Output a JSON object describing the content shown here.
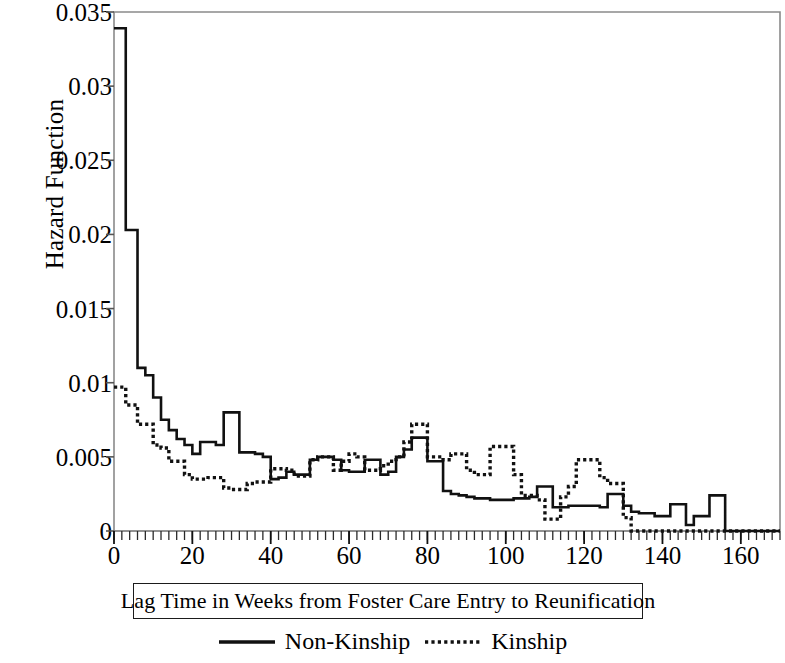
{
  "chart_data": {
    "type": "line",
    "title": "",
    "xlabel": "Lag Time in Weeks from Foster Care Entry to Reunification",
    "ylabel": "Hazard Function",
    "xlim": [
      0,
      170
    ],
    "ylim": [
      0,
      0.035
    ],
    "grid": false,
    "legend_position": "bottom",
    "xticks": [
      0,
      20,
      40,
      60,
      80,
      100,
      120,
      140,
      160
    ],
    "xtick_labels": [
      "0",
      "20",
      "40",
      "60",
      "80",
      "100",
      "120",
      "140",
      "160"
    ],
    "x_minor_tick_interval": 2,
    "yticks": [
      0,
      0.005,
      0.01,
      0.015,
      0.02,
      0.025,
      0.03,
      0.035
    ],
    "ytick_labels": [
      "0",
      "0.005",
      "0.01",
      "0.015",
      "0.02",
      "0.025",
      "0.03",
      "0.035"
    ],
    "line_style": "step-post",
    "series": [
      {
        "name": "Non-Kinship",
        "style": "solid",
        "color": "#111111",
        "x": [
          0,
          3,
          6,
          8,
          10,
          12,
          14,
          16,
          18,
          20,
          22,
          24,
          26,
          28,
          30,
          32,
          34,
          36,
          38,
          40,
          42,
          44,
          46,
          48,
          50,
          52,
          54,
          56,
          58,
          60,
          62,
          64,
          66,
          68,
          70,
          72,
          74,
          76,
          78,
          80,
          82,
          84,
          86,
          88,
          90,
          92,
          94,
          96,
          98,
          100,
          102,
          104,
          106,
          108,
          110,
          112,
          114,
          116,
          118,
          120,
          122,
          124,
          126,
          128,
          130,
          132,
          134,
          136,
          138,
          140,
          142,
          144,
          146,
          148,
          150,
          152,
          154,
          156,
          158,
          160,
          162,
          164,
          166,
          168,
          170
        ],
        "y": [
          0.0339,
          0.0203,
          0.011,
          0.0105,
          0.009,
          0.0075,
          0.0068,
          0.0062,
          0.0058,
          0.0052,
          0.006,
          0.006,
          0.0058,
          0.008,
          0.008,
          0.0053,
          0.0053,
          0.0052,
          0.005,
          0.0035,
          0.0036,
          0.004,
          0.0038,
          0.0038,
          0.0048,
          0.005,
          0.005,
          0.0048,
          0.0041,
          0.004,
          0.004,
          0.0048,
          0.0048,
          0.0038,
          0.004,
          0.005,
          0.0055,
          0.0063,
          0.0063,
          0.0047,
          0.0047,
          0.0027,
          0.0025,
          0.0024,
          0.0023,
          0.0022,
          0.0022,
          0.0021,
          0.0021,
          0.0021,
          0.0022,
          0.0022,
          0.0023,
          0.003,
          0.003,
          0.0016,
          0.0016,
          0.0017,
          0.0017,
          0.0017,
          0.0017,
          0.0016,
          0.0025,
          0.0025,
          0.0017,
          0.0013,
          0.0012,
          0.0012,
          0.001,
          0.001,
          0.0018,
          0.0018,
          0.0004,
          0.001,
          0.001,
          0.0024,
          0.0024,
          0.0,
          0.0,
          0.0,
          0.0,
          0.0,
          0.0,
          0.0,
          0.0
        ]
      },
      {
        "name": "Kinship",
        "style": "dotted",
        "color": "#111111",
        "x": [
          0,
          3,
          6,
          8,
          10,
          12,
          14,
          16,
          18,
          20,
          22,
          24,
          26,
          28,
          30,
          32,
          34,
          36,
          38,
          40,
          42,
          44,
          46,
          48,
          50,
          52,
          54,
          56,
          58,
          60,
          62,
          64,
          66,
          68,
          70,
          72,
          74,
          76,
          78,
          80,
          82,
          84,
          86,
          88,
          90,
          92,
          94,
          96,
          98,
          100,
          102,
          104,
          106,
          108,
          110,
          112,
          114,
          116,
          118,
          120,
          122,
          124,
          126,
          128,
          130,
          132,
          134,
          136,
          138,
          140,
          142,
          144,
          146,
          148,
          150,
          152,
          154,
          156,
          158,
          160,
          162,
          164,
          166,
          168,
          170
        ],
        "y": [
          0.0097,
          0.0085,
          0.0072,
          0.0072,
          0.0058,
          0.0056,
          0.0047,
          0.0047,
          0.0038,
          0.0035,
          0.0035,
          0.0036,
          0.0036,
          0.0029,
          0.0028,
          0.0028,
          0.0032,
          0.0033,
          0.0033,
          0.0042,
          0.0042,
          0.0041,
          0.0037,
          0.0037,
          0.0048,
          0.005,
          0.005,
          0.0041,
          0.0047,
          0.0052,
          0.005,
          0.0041,
          0.0041,
          0.0044,
          0.0047,
          0.005,
          0.006,
          0.0072,
          0.0072,
          0.005,
          0.005,
          0.0048,
          0.0052,
          0.0052,
          0.0041,
          0.0038,
          0.0038,
          0.0057,
          0.0057,
          0.0057,
          0.0038,
          0.0024,
          0.0024,
          0.0021,
          0.0008,
          0.0008,
          0.0023,
          0.003,
          0.0048,
          0.0048,
          0.0048,
          0.0036,
          0.0032,
          0.0032,
          0.0009,
          0.0,
          0.0,
          0.0,
          0.0,
          0.0,
          0.0,
          0.0,
          0.0,
          0.0,
          0.0,
          0.0,
          0.0,
          0.0,
          0.0,
          0.0,
          0.0,
          0.0,
          0.0,
          0.0,
          0.0
        ]
      }
    ]
  },
  "legend": {
    "items": [
      {
        "label": "Non-Kinship",
        "style": "solid"
      },
      {
        "label": "Kinship",
        "style": "dotted"
      }
    ]
  },
  "axes": {
    "xlabel": "Lag Time in Weeks from Foster Care Entry to Reunification",
    "ylabel": "Hazard Function"
  }
}
